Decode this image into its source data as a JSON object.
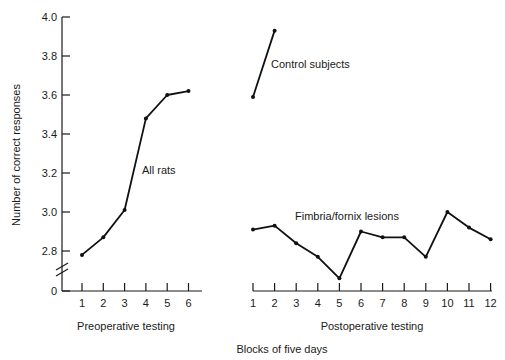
{
  "chart_data": {
    "type": "line",
    "title": "",
    "ylabel": "Number of correct responses",
    "xlabel": "Blocks of five days",
    "ylim": [
      2.6,
      4.0
    ],
    "y_ticks": [
      "4.0",
      "3.8",
      "3.6",
      "3.4",
      "3.2",
      "3.0",
      "2.8",
      "0"
    ],
    "y_axis_break": true,
    "grid": false,
    "panels": [
      {
        "name": "Preoperative testing",
        "x": [
          1,
          2,
          3,
          4,
          5,
          6
        ],
        "series": [
          {
            "name": "All rats",
            "values": [
              2.78,
              2.87,
              3.01,
              3.48,
              3.6,
              3.62
            ]
          }
        ]
      },
      {
        "name": "Postoperative testing",
        "x": [
          1,
          2,
          3,
          4,
          5,
          6,
          7,
          8,
          9,
          10,
          11,
          12
        ],
        "series": [
          {
            "name": "Control subjects",
            "values": [
              3.59,
              3.93,
              null,
              null,
              null,
              null,
              null,
              null,
              null,
              null,
              null,
              null
            ]
          },
          {
            "name": "Fimbria/fornix lesions",
            "values": [
              2.91,
              2.93,
              2.84,
              2.77,
              2.66,
              2.9,
              2.87,
              2.87,
              2.77,
              3.0,
              2.92,
              2.86
            ]
          }
        ]
      }
    ],
    "annotations": [
      "All rats",
      "Control subjects",
      "Fimbria/fornix lesions"
    ]
  },
  "labels": {
    "ylabel": "Number of correct responses",
    "xlabel": "Blocks of five days",
    "pre_panel": "Preoperative testing",
    "post_panel": "Postoperative testing",
    "all_rats": "All rats",
    "control": "Control subjects",
    "fimbria": "Fimbria/fornix lesions"
  }
}
